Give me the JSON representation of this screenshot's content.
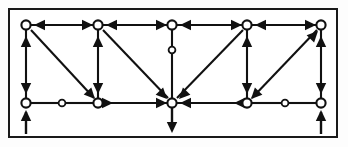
{
  "figure": {
    "type": "node-link-diagram",
    "border_color": "#1a1a1a",
    "line_color": "#111111",
    "node_fill": "#ffffff",
    "background": "#ffffff",
    "frame": {
      "x": 8,
      "y": 8,
      "width": 330,
      "height": 130
    }
  },
  "graph": {
    "node_count": 10,
    "marker_count": 3,
    "columns_x": [
      26,
      98,
      172,
      247,
      321
    ],
    "row_top_y": 25,
    "row_bottom_y": 103,
    "nodes": [
      {
        "id": "t1",
        "label": "",
        "x": 26,
        "y": 25,
        "row": "top",
        "col": 0,
        "shape": "hollow-circle",
        "r": 4.6
      },
      {
        "id": "t2",
        "label": "",
        "x": 98,
        "y": 25,
        "row": "top",
        "col": 1,
        "shape": "hollow-circle",
        "r": 4.6
      },
      {
        "id": "t3",
        "label": "",
        "x": 172,
        "y": 25,
        "row": "top",
        "col": 2,
        "shape": "hollow-circle",
        "r": 4.6
      },
      {
        "id": "t4",
        "label": "",
        "x": 247,
        "y": 25,
        "row": "top",
        "col": 3,
        "shape": "hollow-circle",
        "r": 4.6
      },
      {
        "id": "t5",
        "label": "",
        "x": 321,
        "y": 25,
        "row": "top",
        "col": 4,
        "shape": "hollow-circle",
        "r": 4.6
      },
      {
        "id": "b1",
        "label": "",
        "x": 26,
        "y": 103,
        "row": "bottom",
        "col": 0,
        "shape": "hollow-circle",
        "r": 4.6
      },
      {
        "id": "b2",
        "label": "",
        "x": 98,
        "y": 103,
        "row": "bottom",
        "col": 1,
        "shape": "hollow-circle",
        "r": 4.6
      },
      {
        "id": "b3",
        "label": "",
        "x": 172,
        "y": 103,
        "row": "bottom",
        "col": 2,
        "shape": "hollow-circle",
        "r": 4.6
      },
      {
        "id": "b4",
        "label": "",
        "x": 247,
        "y": 103,
        "row": "bottom",
        "col": 3,
        "shape": "hollow-circle",
        "r": 4.6
      },
      {
        "id": "b5",
        "label": "",
        "x": 321,
        "y": 103,
        "row": "bottom",
        "col": 4,
        "shape": "hollow-circle",
        "r": 4.6
      }
    ],
    "edge_markers": [
      {
        "id": "m1",
        "label": "o",
        "x": 62,
        "y": 103,
        "on_edge": "b1-b2",
        "shape": "small-hollow-circle",
        "r": 3.4
      },
      {
        "id": "m2",
        "label": "o",
        "x": 172,
        "y": 50,
        "on_edge": "t3-b3",
        "shape": "small-hollow-circle",
        "r": 3.4
      },
      {
        "id": "m3",
        "label": "o",
        "x": 285,
        "y": 103,
        "on_edge": "b4-b5",
        "shape": "small-hollow-circle",
        "r": 3.4
      }
    ],
    "edges": [
      {
        "id": "e-t2-t1",
        "from": "t2",
        "to": "t1",
        "kind": "horizontal-top",
        "arrow": "to"
      },
      {
        "id": "e-t3-t2",
        "from": "t3",
        "to": "t2",
        "kind": "horizontal-top",
        "arrow": "to"
      },
      {
        "id": "e-t2-t3",
        "from": "t2",
        "to": "t3",
        "kind": "horizontal-top",
        "arrow": "to"
      },
      {
        "id": "e-t4-t3",
        "from": "t4",
        "to": "t3",
        "kind": "horizontal-top",
        "arrow": "to"
      },
      {
        "id": "e-t4-t5",
        "from": "t4",
        "to": "t5",
        "kind": "horizontal-top",
        "arrow": "to"
      },
      {
        "id": "e-t5-t4",
        "from": "t5",
        "to": "t4",
        "kind": "horizontal-top",
        "arrow": "to"
      },
      {
        "id": "e-b1-t1",
        "from": "b1",
        "to": "t1",
        "kind": "vertical-left",
        "arrow": "to"
      },
      {
        "id": "e-t1-b1",
        "from": "t1",
        "to": "b1",
        "kind": "vertical-left",
        "arrow": "to"
      },
      {
        "id": "e-b2-t2",
        "from": "b2",
        "to": "t2",
        "kind": "vertical",
        "arrow": "to"
      },
      {
        "id": "e-t2-b2",
        "from": "t2",
        "to": "b2",
        "kind": "vertical",
        "arrow": "to"
      },
      {
        "id": "e-t3-b3",
        "from": "t3",
        "to": "b3",
        "kind": "vertical-center",
        "arrow": "none"
      },
      {
        "id": "e-b4-t4",
        "from": "b4",
        "to": "t4",
        "kind": "vertical",
        "arrow": "to"
      },
      {
        "id": "e-t4-b4",
        "from": "t4",
        "to": "b4",
        "kind": "vertical",
        "arrow": "to"
      },
      {
        "id": "e-b5-t5",
        "from": "b5",
        "to": "t5",
        "kind": "vertical-right",
        "arrow": "to"
      },
      {
        "id": "e-t5-b5",
        "from": "t5",
        "to": "b5",
        "kind": "vertical-right",
        "arrow": "to"
      },
      {
        "id": "e-b1-b2",
        "from": "b1",
        "to": "b2",
        "kind": "horizontal-bottom",
        "arrow": "none"
      },
      {
        "id": "e-b2-b3",
        "from": "b2",
        "to": "b3",
        "kind": "horizontal-bottom",
        "arrow": "to"
      },
      {
        "id": "e-b3-b2",
        "from": "b3",
        "to": "b2",
        "kind": "horizontal-bottom",
        "arrow": "to"
      },
      {
        "id": "e-b4-b3",
        "from": "b4",
        "to": "b3",
        "kind": "horizontal-bottom",
        "arrow": "to"
      },
      {
        "id": "e-b3-b4",
        "from": "b3",
        "to": "b4",
        "kind": "horizontal-bottom",
        "arrow": "to"
      },
      {
        "id": "e-b4-b5",
        "from": "b4",
        "to": "b5",
        "kind": "horizontal-bottom",
        "arrow": "none"
      },
      {
        "id": "e-t1-b2d",
        "from": "t1",
        "to": "b2",
        "kind": "diagonal",
        "arrow": "to"
      },
      {
        "id": "e-t2-b3d",
        "from": "t2",
        "to": "b3",
        "kind": "diagonal",
        "arrow": "to"
      },
      {
        "id": "e-t4-b3d",
        "from": "t4",
        "to": "b3",
        "kind": "diagonal",
        "arrow": "to"
      },
      {
        "id": "e-b4-t5d",
        "from": "b4",
        "to": "t5",
        "kind": "diagonal",
        "arrow": "to"
      }
    ],
    "external_stubs": [
      {
        "id": "s-left",
        "at": "b1",
        "direction": "in-from-below",
        "x": 26,
        "from_y": 134,
        "to_y": 103
      },
      {
        "id": "s-center",
        "at": "b3",
        "direction": "out-downward",
        "x": 172,
        "from_y": 103,
        "to_y": 134
      },
      {
        "id": "s-right",
        "at": "b5",
        "direction": "in-from-below",
        "x": 321,
        "from_y": 134,
        "to_y": 103
      }
    ]
  }
}
